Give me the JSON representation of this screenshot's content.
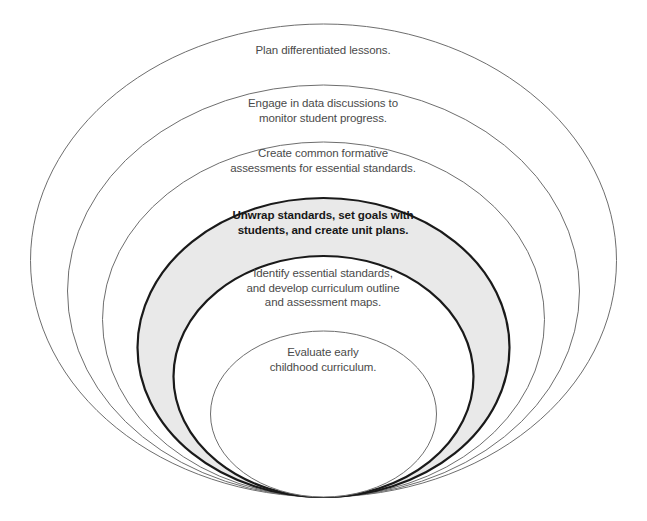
{
  "diagram": {
    "type": "nested-ellipses",
    "title": "",
    "background_color": "#ffffff",
    "highlight_fill_color": "#e9e9e9",
    "highlight_stroke_color": "#1a1a1a",
    "thin_stroke_color": "#6e6e6e",
    "text_color": "#4a4a4a",
    "highlight_text_color": "#171717",
    "common_bottom_y": 497,
    "rings": [
      {
        "index": 0,
        "level": "outermost",
        "label": "Plan differentiated lessons.",
        "emphasis": "normal",
        "fill": "none",
        "stroke": "#6e6e6e",
        "stroke_width": 1,
        "cx": 323.5,
        "cy": 260.5,
        "rx": 293,
        "ry": 236.5
      },
      {
        "index": 1,
        "level": "second",
        "label": "Engage in data discussions to\nmonitor student progress.",
        "emphasis": "normal",
        "fill": "none",
        "stroke": "#6e6e6e",
        "stroke_width": 1,
        "cx": 323.5,
        "cy": 291,
        "rx": 256,
        "ry": 206
      },
      {
        "index": 2,
        "level": "third",
        "label": "Create common formative\nassessments for essential standards.",
        "emphasis": "normal",
        "fill": "none",
        "stroke": "#6e6e6e",
        "stroke_width": 1,
        "cx": 323.5,
        "cy": 319.5,
        "rx": 221,
        "ry": 177.5
      },
      {
        "index": 3,
        "level": "highlighted",
        "label": "Unwrap standards, set goals with\nstudents, and create unit plans.",
        "emphasis": "bold",
        "fill": "#e9e9e9",
        "stroke": "#1a1a1a",
        "stroke_width": 2.2,
        "cx": 323.5,
        "cy": 347.5,
        "rx": 186,
        "ry": 149.5
      },
      {
        "index": 4,
        "level": "fifth",
        "label": "Identify essential standards,\nand develop curriculum outline\nand assessment maps.",
        "emphasis": "normal",
        "fill": "#ffffff",
        "stroke": "#1a1a1a",
        "stroke_width": 2.2,
        "cx": 323.5,
        "cy": 376.5,
        "rx": 150,
        "ry": 120.5
      },
      {
        "index": 5,
        "level": "innermost",
        "label": "Evaluate early\nchildhood curriculum.",
        "emphasis": "normal",
        "fill": "#ffffff",
        "stroke": "#6e6e6e",
        "stroke_width": 1,
        "cx": 323.5,
        "cy": 414,
        "rx": 113,
        "ry": 83
      }
    ]
  }
}
